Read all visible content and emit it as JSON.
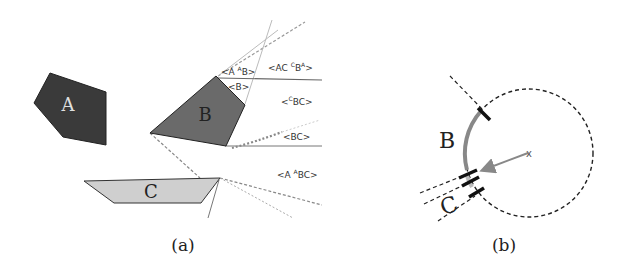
{
  "panel_a": {
    "caption": "(a)",
    "polygons": [
      {
        "label": "A",
        "fill": "#3a3a3a",
        "label_color": "#e0e0e0"
      },
      {
        "label": "B",
        "fill": "#6a6a6a",
        "label_color": "#222222"
      },
      {
        "label": "C",
        "fill": "#cfcfcf",
        "label_color": "#222222"
      }
    ],
    "region_labels": [
      {
        "id": "a-ab",
        "pre": "<A ",
        "sup": "A",
        "post": "B>"
      },
      {
        "id": "ac-cba",
        "pre": "<AC ",
        "sup": "C",
        "mid": "B",
        "sup2": "A",
        "post": ">"
      },
      {
        "id": "b",
        "pre": "<B>"
      },
      {
        "id": "cbc",
        "pre": "<",
        "sup": "C",
        "post": "BC>"
      },
      {
        "id": "bc",
        "pre": "<BC>"
      },
      {
        "id": "a-abc",
        "pre": "<A ",
        "sup": "A",
        "post": "BC>"
      }
    ]
  },
  "panel_b": {
    "caption": "(b)",
    "labels": {
      "b": "B",
      "c": "C"
    },
    "center_marker": "x"
  }
}
